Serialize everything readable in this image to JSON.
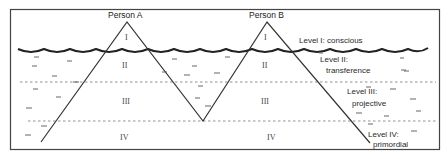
{
  "diagram": {
    "persons": [
      {
        "label": "Person A",
        "peak": [
          127,
          22
        ],
        "levels": [
          "I",
          "II",
          "III",
          "IV"
        ]
      },
      {
        "label": "Person B",
        "peak": [
          267,
          22
        ],
        "levels": [
          "I",
          "II",
          "III",
          "IV"
        ]
      }
    ],
    "levels": [
      {
        "line1": "Level I: conscious"
      },
      {
        "line1": "Level II:",
        "line2": "transference"
      },
      {
        "line1": "Level III:",
        "line2": "projective"
      },
      {
        "line1": "Level IV:",
        "line2": "primordial"
      }
    ],
    "colors": {
      "stroke": "#333333",
      "dash": "#777777",
      "background": "#ffffff"
    }
  }
}
